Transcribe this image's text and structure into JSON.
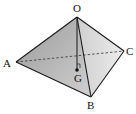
{
  "diagram": {
    "type": "tetrahedron",
    "vertices": {
      "O": {
        "label": "O",
        "x": 77,
        "y": 17
      },
      "A": {
        "label": "A",
        "x": 16,
        "y": 62
      },
      "B": {
        "label": "B",
        "x": 91,
        "y": 97
      },
      "C": {
        "label": "C",
        "x": 124,
        "y": 51
      }
    },
    "points": {
      "G": {
        "label": "G",
        "x": 77,
        "y": 70
      }
    },
    "edges_solid": [
      "OA",
      "OB",
      "OC",
      "AB",
      "BC"
    ],
    "edges_dashed": [
      "AC"
    ],
    "segments": [
      "OG"
    ],
    "marks": [
      "right-angle at G"
    ],
    "colors": {
      "face_dark": "#8a8a8a",
      "face_light": "#dcdcdc",
      "edge": "#1a1a1a"
    }
  }
}
